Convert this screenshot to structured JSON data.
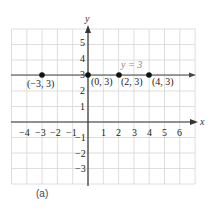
{
  "chart_data": {
    "type": "scatter",
    "title": "",
    "xlabel": "x",
    "ylabel": "y",
    "xlim": [
      -5,
      7
    ],
    "ylim": [
      -4,
      6
    ],
    "grid": true,
    "x_ticks": [
      -4,
      -3,
      -2,
      -1,
      1,
      2,
      3,
      4,
      5,
      6
    ],
    "y_ticks": [
      -3,
      -2,
      -1,
      1,
      2,
      3,
      4,
      5
    ],
    "series": [
      {
        "name": "y = 3",
        "kind": "horizontal-line",
        "y": 3,
        "points": [
          {
            "x": -3,
            "y": 3,
            "label": "(−3, 3)"
          },
          {
            "x": 0,
            "y": 3,
            "label": "(0, 3)"
          },
          {
            "x": 2,
            "y": 3,
            "label": "(2, 3)"
          },
          {
            "x": 4,
            "y": 3,
            "label": "(4, 3)"
          }
        ]
      }
    ],
    "annotations": [
      {
        "text": "y = 3",
        "x": 2.9,
        "y": 3.5
      }
    ],
    "caption": "(a)"
  },
  "labels": {
    "x_axis": "x",
    "y_axis": "y",
    "line_eq": "y = 3",
    "caption": "(a)",
    "x_ticks": [
      "−4",
      "−3",
      "−2",
      "−1",
      "1",
      "2",
      "3",
      "4",
      "5",
      "6"
    ],
    "y_ticks": [
      "5",
      "4",
      "3",
      "2",
      "1",
      "−1",
      "−2",
      "−3"
    ],
    "points": [
      "(−3, 3)",
      "(0, 3)",
      "(2, 3)",
      "(4, 3)"
    ]
  },
  "colors": {
    "grid": "#d6d6d6",
    "axis": "#333333",
    "point": "#111111",
    "line": "#444444"
  }
}
